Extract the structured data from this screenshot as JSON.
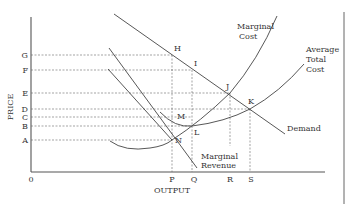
{
  "axes": {
    "y_label": "PRICE",
    "x_label": "OUTPUT",
    "origin_label": "0"
  },
  "price_levels": [
    {
      "label": "G",
      "y": 55
    },
    {
      "label": "F",
      "y": 70
    },
    {
      "label": "E",
      "y": 93
    },
    {
      "label": "D",
      "y": 109
    },
    {
      "label": "C",
      "y": 117
    },
    {
      "label": "B",
      "y": 126
    },
    {
      "label": "A",
      "y": 140
    }
  ],
  "output_levels": [
    {
      "label": "P",
      "x": 172
    },
    {
      "label": "Q",
      "x": 192
    },
    {
      "label": "R",
      "x": 230
    },
    {
      "label": "S",
      "x": 250
    }
  ],
  "points": [
    {
      "label": "H",
      "x": 172,
      "y": 55
    },
    {
      "label": "I",
      "x": 192,
      "y": 70
    },
    {
      "label": "J",
      "x": 230,
      "y": 93
    },
    {
      "label": "K",
      "x": 250,
      "y": 109
    },
    {
      "label": "M",
      "x": 192,
      "y": 117
    },
    {
      "label": "L",
      "x": 192,
      "y": 126
    },
    {
      "label": "N",
      "x": 172,
      "y": 140
    }
  ],
  "curves": {
    "marginal_cost": {
      "line1": "Marginal",
      "line2": "Cost"
    },
    "average_total_cost": {
      "line1": "Average",
      "line2": "Total",
      "line3": "Cost"
    },
    "demand": {
      "label": "Demand"
    },
    "marginal_revenue": {
      "line1": "Marginal",
      "line2": "Revenue"
    }
  },
  "colors": {
    "line": "#444444",
    "text": "#333333",
    "background": "#ffffff"
  }
}
